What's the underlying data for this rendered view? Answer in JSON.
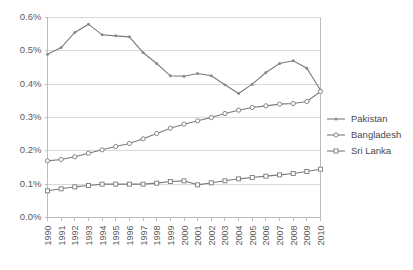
{
  "chart_data": {
    "type": "line",
    "title": "",
    "subtitle": "",
    "xlabel": "",
    "ylabel": "",
    "categories": [
      "1990",
      "1991",
      "1992",
      "1993",
      "1994",
      "1995",
      "1996",
      "1997",
      "1998",
      "1999",
      "2000",
      "2001",
      "2002",
      "2003",
      "2004",
      "2005",
      "2006",
      "2007",
      "2008",
      "2009",
      "2010"
    ],
    "ylim": [
      0.0,
      0.6
    ],
    "ytick_labels": [
      "0.6%",
      "0.5%",
      "0.4%",
      "0.3%",
      "0.2%",
      "0.1%",
      "0.0%"
    ],
    "ytick_values": [
      0.6,
      0.5,
      0.4,
      0.3,
      0.2,
      0.1,
      0.0
    ],
    "grid": true,
    "legend_position": "right",
    "series": [
      {
        "name": "Pakistan",
        "marker": "dot",
        "color": "#7a7a7a",
        "values": [
          0.49,
          0.51,
          0.555,
          0.58,
          0.548,
          0.545,
          0.542,
          0.495,
          0.462,
          0.425,
          0.424,
          0.432,
          0.425,
          0.398,
          0.372,
          0.4,
          0.435,
          0.462,
          0.47,
          0.448,
          0.382
        ]
      },
      {
        "name": "Bangladesh",
        "marker": "circle",
        "color": "#7a7a7a",
        "values": [
          0.17,
          0.174,
          0.182,
          0.193,
          0.203,
          0.213,
          0.222,
          0.236,
          0.252,
          0.268,
          0.28,
          0.29,
          0.3,
          0.312,
          0.322,
          0.33,
          0.335,
          0.34,
          0.342,
          0.348,
          0.378
        ]
      },
      {
        "name": "Sri Lanka",
        "marker": "cross",
        "color": "#7a7a7a",
        "values": [
          0.08,
          0.086,
          0.092,
          0.096,
          0.1,
          0.1,
          0.1,
          0.1,
          0.103,
          0.108,
          0.11,
          0.098,
          0.104,
          0.11,
          0.116,
          0.12,
          0.124,
          0.128,
          0.132,
          0.138,
          0.145
        ]
      }
    ]
  },
  "legend": {
    "items": [
      {
        "label": "Pakistan"
      },
      {
        "label": "Bangladesh"
      },
      {
        "label": "Sri Lanka"
      }
    ]
  }
}
